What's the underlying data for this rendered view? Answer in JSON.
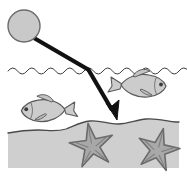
{
  "illustration": {
    "title": "Light ray refracting at water surface with fish and starfish",
    "canvas": {
      "width": 187,
      "height": 176,
      "background": "#ffffff"
    },
    "colors": {
      "ink": "#1a1a1a",
      "outline": "#555555",
      "body_fill": "#c9c9c9",
      "body_fill_light": "#d5d5d5",
      "seabed_fill": "#cfcfcf",
      "starfish_fill": "#a8a8a8",
      "starfish_outline": "#6b6b6b",
      "water_line": "#3a3a3a",
      "ray": "#111111",
      "background": "#ffffff"
    },
    "elements": [
      {
        "name": "light-source",
        "label": "Sun / light source circle",
        "shape": "circle",
        "cx": 24,
        "cy": 26,
        "r": 16,
        "fill": "#c9c9c9",
        "stroke": "#6b6b6b",
        "stroke_width": 1.4
      },
      {
        "name": "incident-ray",
        "label": "Incident light ray from source to water surface",
        "shape": "polyline",
        "points": "34,38 89,70",
        "stroke": "#111111",
        "stroke_width": 4
      },
      {
        "name": "refracted-ray",
        "label": "Refracted ray bending down toward seabed",
        "shape": "polyline",
        "points": "89,70 114,114",
        "stroke": "#111111",
        "stroke_width": 4
      },
      {
        "name": "ray-arrowhead",
        "label": "Arrowhead at end of refracted ray",
        "shape": "triangle",
        "fill": "#111111"
      },
      {
        "name": "water-surface-line",
        "label": "Wavy water surface line",
        "shape": "wave-path",
        "y": 70,
        "amplitude": 4,
        "wavelength": 19,
        "x_start": 8,
        "x_end": 180,
        "stroke": "#3a3a3a",
        "stroke_width": 1
      },
      {
        "name": "fish-right",
        "label": "Fish swimming right",
        "shape": "fish",
        "x": 120,
        "y": 78,
        "scale": 1.0,
        "facing": "right",
        "fill": "#cccccc",
        "stroke": "#5a5a5a"
      },
      {
        "name": "fish-left",
        "label": "Fish swimming left",
        "shape": "fish",
        "x": 19,
        "y": 103,
        "scale": 0.95,
        "facing": "left",
        "fill": "#cccccc",
        "stroke": "#5a5a5a"
      },
      {
        "name": "seabed",
        "label": "Sea floor / sandy bed",
        "shape": "area",
        "fill": "#cfcfcf",
        "stroke": "#4a4a4a",
        "top_profile": "undulating"
      },
      {
        "name": "starfish-left",
        "label": "Starfish on seabed (left)",
        "shape": "star",
        "cx": 92,
        "cy": 146,
        "r_outer": 23,
        "r_inner": 8,
        "points": 5,
        "rotation": -10,
        "fill": "#a8a8a8",
        "stroke": "#6b6b6b"
      },
      {
        "name": "starfish-right",
        "label": "Starfish on seabed (right)",
        "shape": "star",
        "cx": 158,
        "cy": 150,
        "r_outer": 22,
        "r_inner": 8,
        "points": 5,
        "rotation": 14,
        "fill": "#a8a8a8",
        "stroke": "#6b6b6b"
      }
    ],
    "annotations": {
      "source_caption": "",
      "surface_caption": "",
      "bed_caption": ""
    }
  }
}
